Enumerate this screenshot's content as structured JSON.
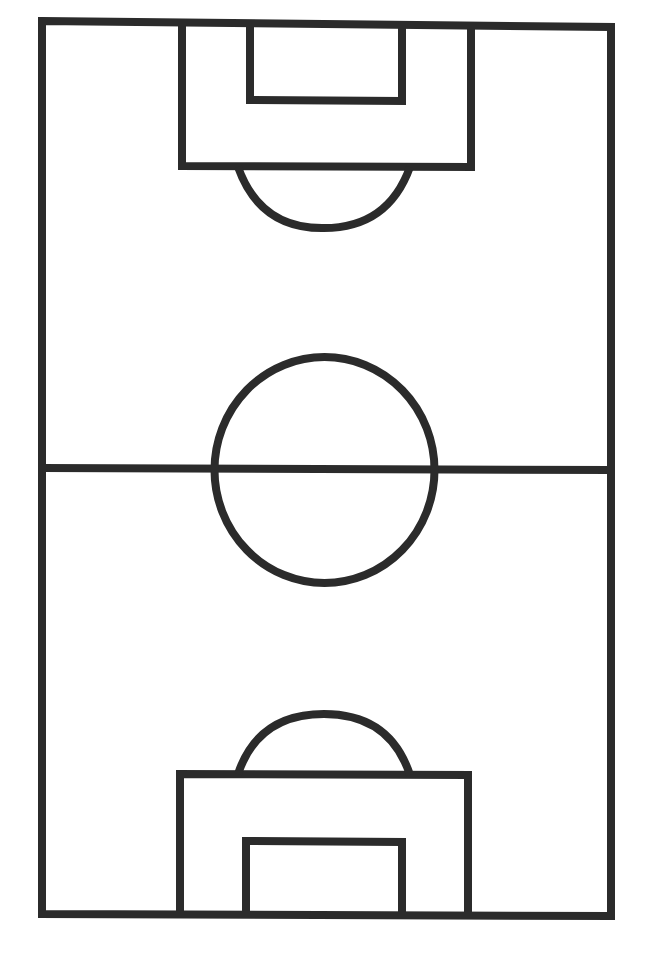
{
  "diagram": {
    "type": "soccer-pitch-outline",
    "orientation": "vertical",
    "colors": {
      "background": "#ffffff",
      "line": "#2b2b2b"
    },
    "line_width": 8,
    "elements": {
      "boundary": {
        "x1": 42,
        "y1": 23,
        "x2": 611,
        "y2": 916
      },
      "halfway_line": {
        "y": 469
      },
      "center_circle": {
        "cx": 324,
        "cy": 470,
        "r": 110
      },
      "top_penalty_box": {
        "x1": 182,
        "y1": 23,
        "x2": 471,
        "y2": 166
      },
      "top_goal_box": {
        "x1": 250,
        "y1": 23,
        "x2": 402,
        "y2": 100
      },
      "top_penalty_arc": {
        "x1": 238,
        "x2": 410,
        "y_base": 166,
        "y_extreme": 227
      },
      "bottom_penalty_box": {
        "x1": 180,
        "y1": 774,
        "x2": 468,
        "y2": 916
      },
      "bottom_goal_box": {
        "x1": 246,
        "y1": 841,
        "x2": 402,
        "y2": 916
      },
      "bottom_penalty_arc": {
        "x1": 238,
        "x2": 410,
        "y_base": 774,
        "y_extreme": 714
      }
    }
  }
}
